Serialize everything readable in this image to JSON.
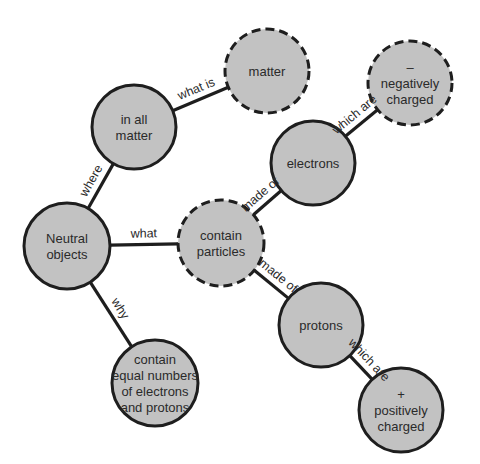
{
  "diagram": {
    "type": "concept-map",
    "colors": {
      "node_fill": "#c2c2c2",
      "stroke": "#1e1e1e",
      "background": "#ffffff",
      "text": "#2a2a2a"
    },
    "nodes": [
      {
        "id": "in_all_matter",
        "lines": [
          "in all",
          "matter"
        ],
        "x": 134,
        "y": 127,
        "r": 42,
        "dashed": false
      },
      {
        "id": "matter",
        "lines": [
          "matter"
        ],
        "x": 267,
        "y": 71,
        "r": 42,
        "dashed": true
      },
      {
        "id": "negatively_charged",
        "lines": [
          "–",
          "negatively",
          "charged"
        ],
        "x": 410,
        "y": 83,
        "r": 42,
        "dashed": true
      },
      {
        "id": "electrons",
        "lines": [
          "electrons"
        ],
        "x": 313,
        "y": 163,
        "r": 42,
        "dashed": false
      },
      {
        "id": "neutral_objects",
        "lines": [
          "Neutral",
          "objects"
        ],
        "x": 67,
        "y": 246,
        "r": 43,
        "dashed": false
      },
      {
        "id": "contain_particles",
        "lines": [
          "contain",
          "particles"
        ],
        "x": 221,
        "y": 243,
        "r": 43,
        "dashed": true
      },
      {
        "id": "protons",
        "lines": [
          "protons"
        ],
        "x": 321,
        "y": 325,
        "r": 42,
        "dashed": false
      },
      {
        "id": "contain_equal",
        "lines": [
          "contain",
          "equal numbers",
          "of electrons",
          "and protons"
        ],
        "x": 155,
        "y": 383,
        "r": 43,
        "dashed": false
      },
      {
        "id": "positively_charged",
        "lines": [
          "+",
          "positively",
          "charged"
        ],
        "x": 401,
        "y": 410,
        "r": 42,
        "dashed": false
      }
    ],
    "edges": [
      {
        "from": "in_all_matter",
        "to": "matter",
        "label": "what is"
      },
      {
        "from": "neutral_objects",
        "to": "in_all_matter",
        "label": "where"
      },
      {
        "from": "neutral_objects",
        "to": "contain_particles",
        "label": "what"
      },
      {
        "from": "neutral_objects",
        "to": "contain_equal",
        "label": "why"
      },
      {
        "from": "contain_particles",
        "to": "electrons",
        "label": "made of"
      },
      {
        "from": "electrons",
        "to": "negatively_charged",
        "label": "which are"
      },
      {
        "from": "contain_particles",
        "to": "protons",
        "label": "made of"
      },
      {
        "from": "protons",
        "to": "positively_charged",
        "label": "which are"
      }
    ]
  }
}
